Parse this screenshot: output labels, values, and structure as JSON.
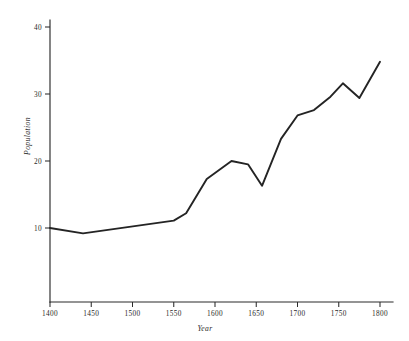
{
  "chart_data": {
    "type": "line",
    "title": "",
    "xlabel": "Year",
    "ylabel": "Population",
    "xlim": [
      1400,
      1800
    ],
    "ylim": [
      0,
      40
    ],
    "grid": false,
    "legend": false,
    "x_ticks": [
      1400,
      1450,
      1500,
      1550,
      1600,
      1650,
      1700,
      1750,
      1800
    ],
    "x_tick_labels": [
      "1400",
      "1450",
      "1500",
      "1550",
      "1600",
      "1650",
      "1700",
      "1750",
      "1800"
    ],
    "y_ticks": [
      10,
      20,
      30,
      40
    ],
    "y_tick_labels": [
      "10",
      "20",
      "30",
      "40"
    ],
    "series": [
      {
        "name": "Population",
        "color": "#242424",
        "points": [
          {
            "x": 1400,
            "y": 10.0
          },
          {
            "x": 1440,
            "y": 9.2
          },
          {
            "x": 1550,
            "y": 11.1
          },
          {
            "x": 1565,
            "y": 12.2
          },
          {
            "x": 1590,
            "y": 17.3
          },
          {
            "x": 1600,
            "y": 18.2
          },
          {
            "x": 1620,
            "y": 20.0
          },
          {
            "x": 1640,
            "y": 19.5
          },
          {
            "x": 1657,
            "y": 16.3
          },
          {
            "x": 1680,
            "y": 23.3
          },
          {
            "x": 1700,
            "y": 26.8
          },
          {
            "x": 1720,
            "y": 27.6
          },
          {
            "x": 1740,
            "y": 29.6
          },
          {
            "x": 1755,
            "y": 31.6
          },
          {
            "x": 1775,
            "y": 29.4
          },
          {
            "x": 1800,
            "y": 34.8
          }
        ]
      }
    ]
  },
  "figure": {
    "background_color": "#ffffff",
    "ink_color": "#242424"
  }
}
